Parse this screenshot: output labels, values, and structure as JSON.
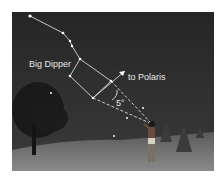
{
  "figure": {
    "labels": {
      "constellation": "Big Dipper",
      "direction": "to Polaris",
      "angle": "5°"
    },
    "colors": {
      "sky": "#2a2a2a",
      "ground": "#6e6e6e",
      "star": "#ffffff",
      "line": "#d8d8d8"
    }
  }
}
